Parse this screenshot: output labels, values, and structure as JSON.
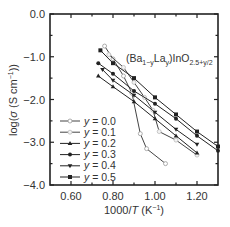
{
  "chart_data": {
    "type": "line",
    "title": "",
    "annotation": {
      "text": "(Ba1−yLay)InO2.5+y/2",
      "parts": [
        {
          "t": "(Ba",
          "sub": false
        },
        {
          "t": "1−y",
          "sub": true
        },
        {
          "t": "La",
          "sub": false
        },
        {
          "t": "y",
          "sub": true
        },
        {
          "t": ")InO",
          "sub": false
        },
        {
          "t": "2.5+y/2",
          "sub": true
        }
      ]
    },
    "xlabel": "1000/T (K⁻¹)",
    "ylabel": "log(σ (S cm⁻¹))",
    "xlim": [
      0.5,
      1.3
    ],
    "ylim": [
      -4.0,
      0.0
    ],
    "xticks": [
      0.6,
      0.8,
      1.0,
      1.2
    ],
    "xtick_labels": [
      "0.60",
      "0.80",
      "1.00",
      "1.20"
    ],
    "xminor_ticks": [
      0.7,
      0.9,
      1.1
    ],
    "yticks": [
      0.0,
      -1.0,
      -2.0,
      -3.0,
      -4.0
    ],
    "ytick_labels": [
      "0.0",
      "−1.0",
      "−2.0",
      "−3.0",
      "−4.0"
    ],
    "yminor_ticks": [
      -0.5,
      -1.5,
      -2.5,
      -3.5
    ],
    "grid": false,
    "legend_position": "lower-left",
    "series": [
      {
        "name": "y = 0.0",
        "marker": "open-circle",
        "color": "#444444",
        "x": [
          0.76,
          0.8,
          0.85,
          0.89,
          0.93,
          0.96,
          1.05
        ],
        "values": [
          -0.75,
          -1.05,
          -1.45,
          -1.85,
          -2.8,
          -3.15,
          -3.5
        ]
      },
      {
        "name": "y = 0.1",
        "marker": "open-circle-light",
        "color": "#444444",
        "x": [
          0.78,
          0.85,
          0.9,
          0.95,
          0.99,
          1.02,
          1.1,
          1.2
        ],
        "values": [
          -0.95,
          -1.25,
          -1.6,
          -1.95,
          -2.25,
          -2.75,
          -2.95,
          -3.3
        ]
      },
      {
        "name": "y = 0.2",
        "marker": "filled-triangle-up",
        "color": "#222222",
        "x": [
          0.73,
          0.8,
          0.9,
          1.0,
          1.1,
          1.2
        ],
        "values": [
          -1.45,
          -1.7,
          -2.05,
          -2.45,
          -2.85,
          -3.25
        ]
      },
      {
        "name": "y = 0.3",
        "marker": "filled-circle",
        "color": "#222222",
        "x": [
          0.73,
          0.8,
          0.9,
          1.0,
          1.1,
          1.2,
          1.3
        ],
        "values": [
          -1.15,
          -1.4,
          -1.8,
          -2.1,
          -2.45,
          -2.85,
          -3.2
        ]
      },
      {
        "name": "y = 0.4",
        "marker": "filled-triangle-down",
        "color": "#222222",
        "x": [
          0.75,
          0.8,
          0.9,
          1.0,
          1.1,
          1.2
        ],
        "values": [
          -1.3,
          -1.55,
          -1.9,
          -2.3,
          -2.7,
          -3.05
        ]
      },
      {
        "name": "y = 0.5",
        "marker": "filled-square",
        "color": "#222222",
        "x": [
          0.74,
          0.8,
          0.9,
          1.0,
          1.1,
          1.2,
          1.3
        ],
        "values": [
          -0.85,
          -1.15,
          -1.5,
          -1.95,
          -2.35,
          -2.75,
          -3.1
        ]
      }
    ]
  },
  "axes": {
    "xlabel_prefix": "1000/",
    "xlabel_var": "T",
    "xlabel_unit": " (K",
    "xlabel_exp": "−1",
    "xlabel_close": ")",
    "ylabel_prefix": "log(",
    "ylabel_var": "σ",
    "ylabel_unit": " (S cm",
    "ylabel_exp": "−1",
    "ylabel_close": "))"
  },
  "legend": {
    "items": [
      {
        "label_var": "y",
        "label_val": " = 0.0"
      },
      {
        "label_var": "y",
        "label_val": " = 0.1"
      },
      {
        "label_var": "y",
        "label_val": " = 0.2"
      },
      {
        "label_var": "y",
        "label_val": " = 0.3"
      },
      {
        "label_var": "y",
        "label_val": " = 0.4"
      },
      {
        "label_var": "y",
        "label_val": " = 0.5"
      }
    ]
  }
}
